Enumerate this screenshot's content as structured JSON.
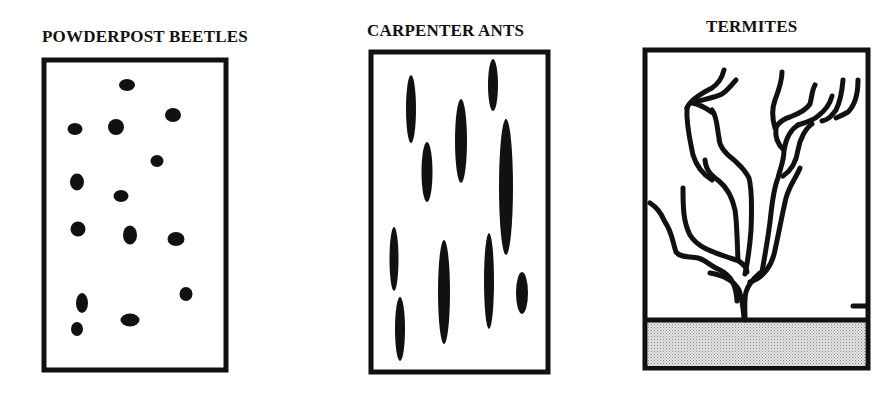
{
  "diagram": {
    "colors": {
      "ink": "#111111",
      "background": "#ffffff",
      "soil": "#cfcfcf"
    },
    "panels": [
      {
        "id": "powderpost-beetles",
        "title": "POWDERPOST BEETLES",
        "pattern": "small round/oval exit holes scattered in wood"
      },
      {
        "id": "carpenter-ants",
        "title": "CARPENTER ANTS",
        "pattern": "long vertical elongated galleries along grain"
      },
      {
        "id": "termites",
        "title": "TERMITES",
        "pattern": "branching mud tubes rising from soil"
      }
    ]
  }
}
